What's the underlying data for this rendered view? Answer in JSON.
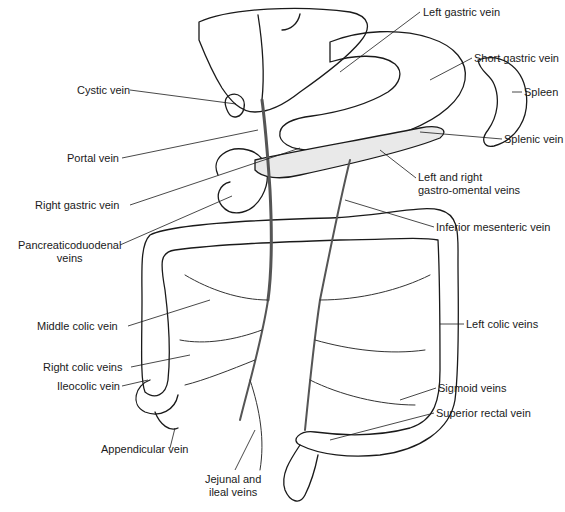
{
  "diagram": {
    "labels": [
      {
        "id": "left-gastric-vein",
        "text": "Left gastric vein",
        "x": 423,
        "y": 6
      },
      {
        "id": "cystic-vein",
        "text": "Cystic vein",
        "x": 77,
        "y": 84
      },
      {
        "id": "short-gastric-vein",
        "text": "Short gastric vein",
        "x": 474,
        "y": 52
      },
      {
        "id": "spleen",
        "text": "Spleen",
        "x": 524,
        "y": 86
      },
      {
        "id": "portal-vein",
        "text": "Portal vein",
        "x": 67,
        "y": 152
      },
      {
        "id": "splenic-vein",
        "text": "Splenic vein",
        "x": 504,
        "y": 133
      },
      {
        "id": "left-and-right-gastro-omental-veins",
        "text": "Left and right\ngastro-omental veins",
        "x": 418,
        "y": 171
      },
      {
        "id": "right-gastric-vein",
        "text": "Right gastric vein",
        "x": 35,
        "y": 199
      },
      {
        "id": "inferior-mesenteric-vein",
        "text": "Inferior mesenteric vein",
        "x": 436,
        "y": 221
      },
      {
        "id": "pancreaticoduodenal-veins",
        "text": "Pancreaticoduodenal\nveins",
        "x": 18,
        "y": 239
      },
      {
        "id": "middle-colic-vein",
        "text": "Middle colic vein",
        "x": 37,
        "y": 320
      },
      {
        "id": "left-colic-veins",
        "text": "Left colic veins",
        "x": 466,
        "y": 318
      },
      {
        "id": "right-colic-veins",
        "text": "Right colic veins",
        "x": 43,
        "y": 361
      },
      {
        "id": "ileocolic-vein",
        "text": "Ileocolic vein",
        "x": 57,
        "y": 380
      },
      {
        "id": "sigmoid-veins",
        "text": "Sigmoid veins",
        "x": 438,
        "y": 382
      },
      {
        "id": "superior-rectal-vein",
        "text": "Superior rectal vein",
        "x": 436,
        "y": 407
      },
      {
        "id": "appendicular-vein",
        "text": "Appendicular vein",
        "x": 101,
        "y": 443
      },
      {
        "id": "jejunal-and-ileal-veins",
        "text": "Jejunal and\nileal veins",
        "x": 205,
        "y": 473
      }
    ]
  }
}
